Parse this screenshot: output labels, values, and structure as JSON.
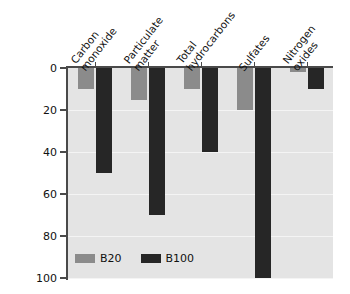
{
  "chart_data": {
    "type": "bar",
    "title": "",
    "subtitle": "",
    "xlabel": "",
    "ylabel": "Percent reduction versus petrodiesel",
    "categories": [
      "Carbon monoxide",
      "Particulate matter",
      "Total hydrocarbons",
      "Sulfates",
      "Nitrogen oxides"
    ],
    "category_lines": [
      [
        "Carbon",
        "monoxide"
      ],
      [
        "Particulate",
        "matter"
      ],
      [
        "Total",
        "hydrocarbons"
      ],
      [
        "Sulfates"
      ],
      [
        "Nitrogen",
        "oxides"
      ]
    ],
    "series": [
      {
        "name": "B20",
        "color": "#8b8b8b",
        "values": [
          10,
          15,
          10,
          20,
          2
        ]
      },
      {
        "name": "B100",
        "color": "#262626",
        "values": [
          50,
          70,
          40,
          100,
          10
        ]
      }
    ],
    "ylim": [
      0,
      100
    ],
    "y_inverted": true,
    "yticks": [
      0,
      20,
      40,
      60,
      80,
      100
    ],
    "ytick_labels": [
      "0",
      "20",
      "40",
      "60",
      "80",
      "100"
    ],
    "grid": true,
    "grid_axis": "y",
    "legend_position": "bottom-left",
    "plot_background": "#e4e4e4",
    "page_background": "#ffffff"
  },
  "legend": {
    "items": [
      {
        "label": "B20"
      },
      {
        "label": "B100"
      }
    ]
  }
}
